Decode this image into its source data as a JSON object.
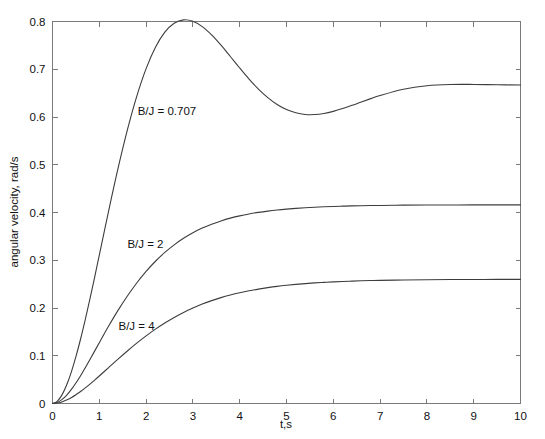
{
  "chart_data": {
    "type": "line",
    "title": "",
    "subtitle": "",
    "xlabel": "t,s",
    "ylabel": "angular velocity, rad/s",
    "xlim": [
      0,
      10
    ],
    "ylim": [
      0,
      0.8
    ],
    "grid": false,
    "legend_position": "inline-annotations",
    "x_ticks": [
      "0",
      "1",
      "2",
      "3",
      "4",
      "5",
      "6",
      "7",
      "8",
      "9",
      "10"
    ],
    "x_tick_values": [
      0,
      1,
      2,
      3,
      4,
      5,
      6,
      7,
      8,
      9,
      10
    ],
    "y_ticks": [
      "0",
      "0.1",
      "0.2",
      "0.3",
      "0.4",
      "0.5",
      "0.6",
      "0.7",
      "0.8"
    ],
    "y_tick_values": [
      0,
      0.1,
      0.2,
      0.3,
      0.4,
      0.5,
      0.6,
      0.7,
      0.8
    ],
    "x": [
      0,
      0.1,
      0.2,
      0.3,
      0.4,
      0.5,
      0.6,
      0.7,
      0.8,
      0.9,
      1.0,
      1.2,
      1.4,
      1.6,
      1.8,
      2.0,
      2.2,
      2.4,
      2.6,
      2.8,
      3.0,
      3.2,
      3.4,
      3.6,
      3.8,
      4.0,
      4.2,
      4.4,
      4.6,
      4.8,
      5.0,
      5.2,
      5.4,
      5.6,
      5.8,
      6.0,
      6.2,
      6.4,
      6.6,
      6.8,
      7.0,
      7.5,
      8.0,
      8.5,
      9.0,
      9.5,
      10.0
    ],
    "series": [
      {
        "name": "B/J = 0.707",
        "label": "B/J = 0.707",
        "color": "#3d3d3d",
        "steady_state": 0.667,
        "peak_value": 0.74,
        "peak_time": 3.1,
        "undershoot_value": 0.657,
        "undershoot_time": 6.2,
        "values": [
          0,
          0.0045,
          0.0175,
          0.038,
          0.065,
          0.0975,
          0.1344,
          0.1749,
          0.218,
          0.263,
          0.309,
          0.4016,
          0.4898,
          0.5701,
          0.64,
          0.6978,
          0.7424,
          0.7738,
          0.7924,
          0.7995,
          0.7965,
          0.7854,
          0.7681,
          0.7467,
          0.7231,
          0.6991,
          0.6761,
          0.6553,
          0.6375,
          0.6232,
          0.6126,
          0.6057,
          0.6023,
          0.6021,
          0.6044,
          0.6088,
          0.6146,
          0.6213,
          0.6284,
          0.6353,
          0.6419,
          0.655,
          0.6622,
          0.6648,
          0.6649,
          0.6641,
          0.6637
        ]
      },
      {
        "name": "B/J = 2",
        "label": "B/J = 2",
        "color": "#3d3d3d",
        "steady_state": 0.416,
        "values": [
          0,
          0.0019,
          0.0073,
          0.0156,
          0.0264,
          0.0391,
          0.0532,
          0.0683,
          0.0841,
          0.1002,
          0.1164,
          0.1482,
          0.1782,
          0.2057,
          0.2306,
          0.2527,
          0.2721,
          0.289,
          0.3035,
          0.316,
          0.3266,
          0.3355,
          0.343,
          0.3493,
          0.3546,
          0.359,
          0.3626,
          0.3656,
          0.3681,
          0.3702,
          0.3719,
          0.3733,
          0.3745,
          0.3755,
          0.3763,
          0.377,
          0.3775,
          0.378,
          0.3784,
          0.3787,
          0.3789,
          0.3794,
          0.3797,
          0.3798,
          0.3799,
          0.38,
          0.38
        ]
      },
      {
        "name": "B/J = 4",
        "label": "B/J = 4",
        "color": "#3d3d3d",
        "steady_state": 0.26,
        "values": [
          0,
          0.001,
          0.0038,
          0.0082,
          0.0139,
          0.0208,
          0.0286,
          0.0371,
          0.0462,
          0.0557,
          0.0655,
          0.0856,
          0.1056,
          0.1251,
          0.1436,
          0.161,
          0.1771,
          0.1917,
          0.205,
          0.2169,
          0.2274,
          0.2367,
          0.2449,
          0.2521,
          0.2583,
          0.2637,
          0.2684,
          0.2724,
          0.2759,
          0.2789,
          0.2814,
          0.2836,
          0.2855,
          0.2871,
          0.2884,
          0.2896,
          0.2906,
          0.2914,
          0.2921,
          0.2927,
          0.2932,
          0.2941,
          0.2947,
          0.2951,
          0.2953,
          0.2955,
          0.2956
        ]
      }
    ],
    "annotations": [
      {
        "text": "B/J = 0.707",
        "x": 1.82,
        "y": 0.605
      },
      {
        "text": "B/J = 2",
        "x": 1.6,
        "y": 0.325
      },
      {
        "text": "B/J = 4",
        "x": 1.41,
        "y": 0.153
      }
    ],
    "colors": {
      "axis": "#7a7a7a",
      "curve": "#3d3d3d",
      "text": "#111111",
      "background": "#ffffff"
    }
  }
}
